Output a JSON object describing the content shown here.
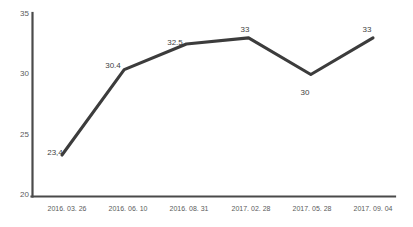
{
  "chart_data": {
    "type": "line",
    "title": "",
    "xlabel": "",
    "ylabel": "",
    "ylim": [
      20,
      35
    ],
    "yticks": [
      "20",
      "25",
      "30",
      "35"
    ],
    "grid": false,
    "legend": "none",
    "line_color": "#3c3c3c",
    "axis_color": "#4a4a4a",
    "text_color": "#5b5b5b",
    "label_color": "#3f3f3f",
    "background": "#ffffff",
    "categories": [
      "2016. 03. 26",
      "2016. 06. 10",
      "2016. 08. 31",
      "2017. 02. 28",
      "2017. 05. 28",
      "2017. 09. 04"
    ],
    "values": [
      23.4,
      30.4,
      32.5,
      33,
      30,
      33
    ],
    "point_labels": [
      "23,4",
      "30.4",
      "32.5",
      "33",
      "30",
      "33"
    ],
    "point_label_positions": [
      "above",
      "above",
      "above",
      "above",
      "below",
      "above"
    ]
  }
}
